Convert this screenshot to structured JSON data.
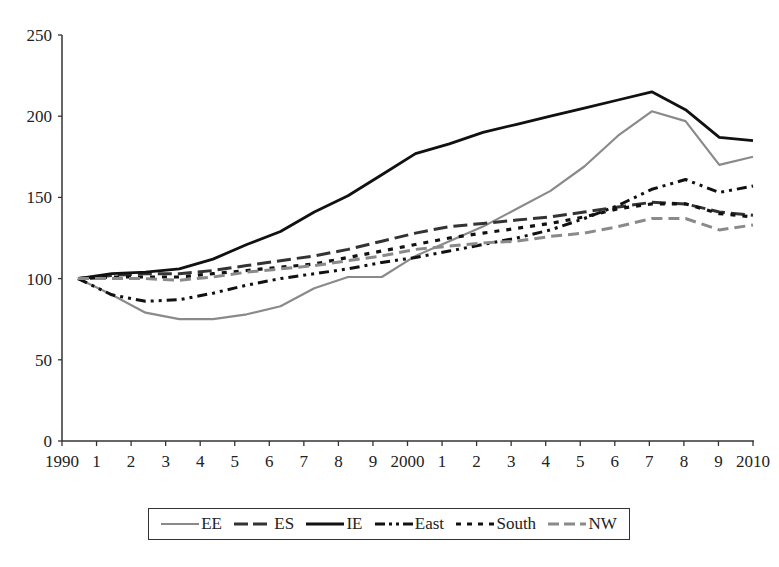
{
  "chart_data": {
    "type": "line",
    "title": "",
    "xlabel": "",
    "ylabel": "",
    "ylim": [
      0,
      250
    ],
    "yticks": [
      0,
      50,
      100,
      150,
      200,
      250
    ],
    "x": [
      1990,
      1991,
      1992,
      1993,
      1994,
      1995,
      1996,
      1997,
      1998,
      1999,
      2000,
      2001,
      2002,
      2003,
      2004,
      2005,
      2006,
      2007,
      2008,
      2009,
      2010
    ],
    "xtick_labels": [
      "1990",
      "1",
      "2",
      "3",
      "4",
      "5",
      "6",
      "7",
      "8",
      "9",
      "2000",
      "1",
      "2",
      "3",
      "4",
      "5",
      "6",
      "7",
      "8",
      "9",
      "2010"
    ],
    "grid": false,
    "legend_position": "bottom",
    "series": [
      {
        "name": "EE",
        "style": "solid",
        "color": "#8a8a8a",
        "values": [
          100,
          90,
          79,
          75,
          75,
          78,
          83,
          94,
          101,
          101,
          114,
          123,
          132,
          143,
          154,
          169,
          188,
          203,
          197,
          170,
          175
        ]
      },
      {
        "name": "ES",
        "style": "longdash",
        "color": "#333333",
        "values": [
          100,
          102,
          103,
          103,
          105,
          108,
          111,
          114,
          118,
          123,
          128,
          132,
          134,
          136,
          138,
          141,
          144,
          147,
          146,
          141,
          139
        ]
      },
      {
        "name": "IE",
        "style": "solid-thick",
        "color": "#111111",
        "values": [
          100,
          103,
          104,
          106,
          112,
          121,
          129,
          141,
          151,
          164,
          177,
          183,
          190,
          195,
          200,
          205,
          210,
          215,
          204,
          187,
          185
        ]
      },
      {
        "name": "East",
        "style": "dashdot",
        "color": "#111111",
        "values": [
          100,
          90,
          86,
          87,
          91,
          96,
          100,
          103,
          106,
          110,
          113,
          117,
          121,
          125,
          130,
          137,
          145,
          155,
          161,
          153,
          157
        ]
      },
      {
        "name": "South",
        "style": "dotted",
        "color": "#111111",
        "values": [
          100,
          101,
          101,
          101,
          103,
          105,
          107,
          109,
          113,
          117,
          121,
          125,
          128,
          131,
          134,
          138,
          143,
          146,
          146,
          140,
          138
        ]
      },
      {
        "name": "NW",
        "style": "dash",
        "color": "#8a8a8a",
        "values": [
          100,
          100,
          100,
          99,
          101,
          104,
          106,
          108,
          111,
          114,
          118,
          120,
          122,
          123,
          126,
          128,
          132,
          137,
          137,
          130,
          133
        ]
      }
    ]
  },
  "legend": {
    "items": [
      {
        "label": "EE"
      },
      {
        "label": "ES"
      },
      {
        "label": "IE"
      },
      {
        "label": "East"
      },
      {
        "label": "South"
      },
      {
        "label": "NW"
      }
    ]
  }
}
